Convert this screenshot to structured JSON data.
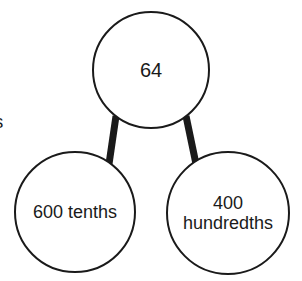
{
  "diagram": {
    "type": "number-bond",
    "stroke_color": "#1a1a1a",
    "fill_color": "#ffffff",
    "text_color": "#1a1a1a",
    "background_color": "#ffffff",
    "circle_stroke_width": 2,
    "connector_stroke_width": 7,
    "nodes": {
      "root": {
        "label": "64",
        "cx": 151,
        "cy": 70,
        "r": 58
      },
      "left_child": {
        "label": "600 tenths",
        "cx": 75,
        "cy": 212,
        "r": 60
      },
      "right_child": {
        "label": "400\nhundredths",
        "cx": 228,
        "cy": 213,
        "r": 61
      }
    },
    "connectors": [
      {
        "name": "root-to-left",
        "x1": 116,
        "y1": 116,
        "x2": 109,
        "y2": 164
      },
      {
        "name": "root-to-right",
        "x1": 186,
        "y1": 116,
        "x2": 196,
        "y2": 164
      }
    ],
    "clipped_text": "ns"
  }
}
